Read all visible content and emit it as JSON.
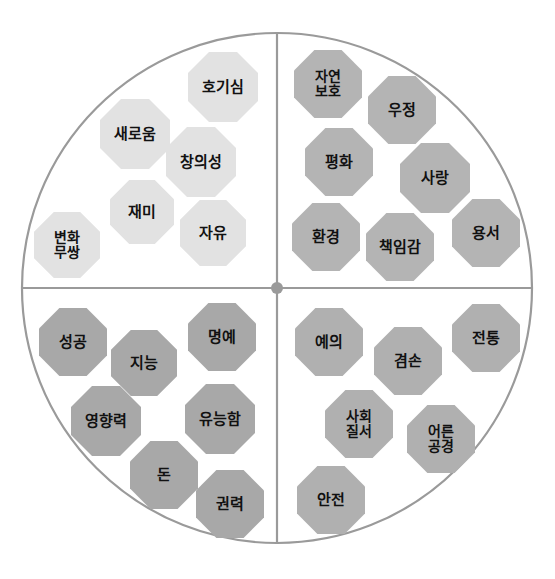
{
  "diagram": {
    "title_fragment": "",
    "type": "values-circle",
    "geometry": {
      "center_x": 277,
      "center_y": 288,
      "radius": 255,
      "outline_color": "#9a9a9a",
      "axis_color": "#9a9a9a",
      "center_dot_color": "#9a9a9a",
      "background": "#ffffff"
    },
    "quadrants": [
      {
        "id": "top-left",
        "fill": "#e2e2e2",
        "nodes": [
          {
            "label": "호기심",
            "x": 188,
            "y": 52,
            "size": 70,
            "font": 15
          },
          {
            "label": "새로움",
            "x": 100,
            "y": 99,
            "size": 70,
            "font": 15
          },
          {
            "label": "창의성",
            "x": 166,
            "y": 127,
            "size": 70,
            "font": 15
          },
          {
            "label": "재미",
            "x": 110,
            "y": 180,
            "size": 64,
            "font": 15
          },
          {
            "label": "자유",
            "x": 180,
            "y": 200,
            "size": 66,
            "font": 15
          },
          {
            "label": "변화\n무쌍",
            "x": 34,
            "y": 212,
            "size": 66,
            "font": 14
          }
        ]
      },
      {
        "id": "top-right",
        "fill": "#b4b4b4",
        "nodes": [
          {
            "label": "자연\n보호",
            "x": 294,
            "y": 50,
            "size": 68,
            "font": 14
          },
          {
            "label": "우정",
            "x": 368,
            "y": 76,
            "size": 68,
            "font": 15
          },
          {
            "label": "평화",
            "x": 305,
            "y": 128,
            "size": 68,
            "font": 15
          },
          {
            "label": "사랑",
            "x": 400,
            "y": 143,
            "size": 70,
            "font": 15
          },
          {
            "label": "환경",
            "x": 292,
            "y": 203,
            "size": 68,
            "font": 15
          },
          {
            "label": "책임감",
            "x": 366,
            "y": 213,
            "size": 68,
            "font": 15
          },
          {
            "label": "용서",
            "x": 452,
            "y": 199,
            "size": 68,
            "font": 15
          }
        ]
      },
      {
        "id": "bottom-left",
        "fill": "#a8a8a8",
        "nodes": [
          {
            "label": "성공",
            "x": 39,
            "y": 308,
            "size": 68,
            "font": 15
          },
          {
            "label": "지능",
            "x": 111,
            "y": 330,
            "size": 66,
            "font": 15
          },
          {
            "label": "명예",
            "x": 188,
            "y": 303,
            "size": 68,
            "font": 15
          },
          {
            "label": "영향력",
            "x": 71,
            "y": 386,
            "size": 70,
            "font": 15
          },
          {
            "label": "유능함",
            "x": 185,
            "y": 384,
            "size": 70,
            "font": 15
          },
          {
            "label": "돈",
            "x": 130,
            "y": 441,
            "size": 68,
            "font": 15
          },
          {
            "label": "권력",
            "x": 196,
            "y": 470,
            "size": 68,
            "font": 15
          }
        ]
      },
      {
        "id": "bottom-right",
        "fill": "#b0b0b0",
        "nodes": [
          {
            "label": "예의",
            "x": 295,
            "y": 308,
            "size": 68,
            "font": 15
          },
          {
            "label": "겸손",
            "x": 374,
            "y": 327,
            "size": 68,
            "font": 15
          },
          {
            "label": "전통",
            "x": 452,
            "y": 304,
            "size": 68,
            "font": 15
          },
          {
            "label": "사회\n질서",
            "x": 325,
            "y": 390,
            "size": 68,
            "font": 14
          },
          {
            "label": "어른\n공경",
            "x": 407,
            "y": 405,
            "size": 68,
            "font": 14
          },
          {
            "label": "안전",
            "x": 297,
            "y": 466,
            "size": 68,
            "font": 15
          }
        ]
      }
    ]
  }
}
